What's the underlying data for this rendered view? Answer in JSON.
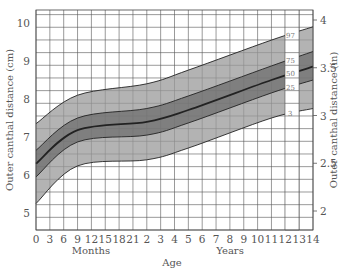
{
  "chart_data": {
    "type": "line",
    "title": "",
    "xlabel": "Age",
    "x_sublabels": [
      "Months",
      "Years"
    ],
    "ylabel_left": "Outer canthal distance (cm)",
    "ylabel_right": "Outer canthal distance (in)",
    "ylim_left": [
      5,
      10
    ],
    "ylim_right": [
      2,
      4
    ],
    "x_tick_labels": [
      "0",
      "3",
      "6",
      "9",
      "12",
      "15",
      "18",
      "21",
      "2",
      "3",
      "4",
      "5",
      "6",
      "7",
      "8",
      "9",
      "10",
      "11",
      "12",
      "13",
      "14"
    ],
    "y_left_ticks": [
      "5",
      "6",
      "7",
      "8",
      "9",
      "10"
    ],
    "y_right_ticks": [
      "2",
      "2.5",
      "3",
      "3.5",
      "4"
    ],
    "grid": true,
    "shaded_bands": [
      "3-97 light gray",
      "25-75 medium gray"
    ],
    "x": [
      "0m",
      "9m",
      "2y",
      "5y",
      "11y",
      "14y"
    ],
    "series": [
      {
        "name": "97",
        "values": [
          7.35,
          8.1,
          8.4,
          8.76,
          9.55,
          9.9
        ]
      },
      {
        "name": "75",
        "values": [
          6.65,
          7.5,
          7.75,
          8.08,
          8.87,
          9.25
        ]
      },
      {
        "name": "50",
        "values": [
          6.3,
          7.18,
          7.4,
          7.71,
          8.5,
          8.85
        ]
      },
      {
        "name": "25",
        "values": [
          5.95,
          6.87,
          7.05,
          7.37,
          8.16,
          8.5
        ]
      },
      {
        "name": "3",
        "values": [
          5.25,
          6.24,
          6.4,
          6.71,
          7.5,
          7.75
        ]
      }
    ]
  },
  "labels": {
    "ylabel_left": "Outer canthal distance (cm)",
    "ylabel_right": "Outer canthal distance (in)",
    "months": "Months",
    "years": "Years",
    "age": "Age",
    "pct97": "97",
    "pct75": "75",
    "pct50": "50",
    "pct25": "25",
    "pct3": "3"
  }
}
